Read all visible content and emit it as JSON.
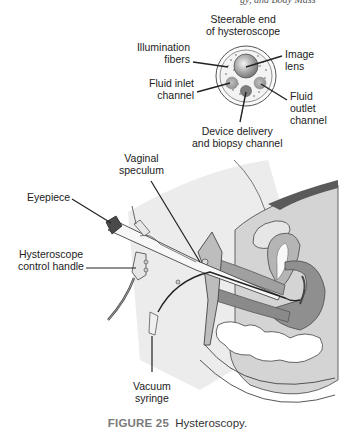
{
  "header": {
    "running_text": "gy, and Body Mass"
  },
  "inset": {
    "title_line1": "Steerable end",
    "title_line2": "of hysteroscope",
    "labels": {
      "illumination_fibers": [
        "Illumination",
        "fibers"
      ],
      "fluid_inlet": [
        "Fluid inlet",
        "channel"
      ],
      "image_lens": [
        "Image",
        "lens"
      ],
      "fluid_outlet": [
        "Fluid",
        "outlet",
        "channel"
      ],
      "device_delivery": [
        "Device delivery",
        "and biopsy channel"
      ]
    }
  },
  "main": {
    "labels": {
      "vaginal_speculum": [
        "Vaginal",
        "speculum"
      ],
      "eyepiece": [
        "Eyepiece"
      ],
      "control_handle": [
        "Hysteroscope",
        "control handle"
      ],
      "vacuum_syringe": [
        "Vacuum",
        "syringe"
      ]
    }
  },
  "caption": {
    "figure_number": "FIGURE 25",
    "text": "Hysteroscopy."
  },
  "colors": {
    "caption_figure": "#7a7a7a",
    "tissue_light": "#d4d4d4",
    "tissue_mid": "#a9a9a9",
    "tissue_dark": "#7d7d7d",
    "lens": "#9a9a9a",
    "background_panel": "#ececec"
  }
}
